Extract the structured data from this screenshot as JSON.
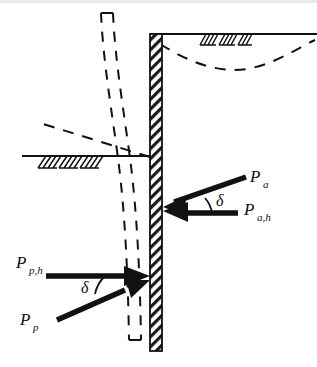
{
  "figure": {
    "kind": "engineering-diagram",
    "title": "",
    "background_color": "#ffffff",
    "line_color": "#111111",
    "width": 317,
    "height": 367
  },
  "labels": {
    "active_resultant": {
      "symbol": "P",
      "subscript": "a"
    },
    "active_horizontal": {
      "symbol": "P",
      "subscript": "a,h"
    },
    "passive_resultant": {
      "symbol": "P",
      "subscript": "p"
    },
    "passive_horizontal": {
      "symbol": "P",
      "subscript": "p,h"
    },
    "angle_active": "δ",
    "angle_passive": "δ"
  },
  "elements": {
    "wall": {
      "name": "retaining-wall",
      "style": "hatched",
      "x": 150,
      "top": 34,
      "bottom": 351,
      "thickness": 12
    },
    "ground_surface_right": {
      "name": "backfill-ground-line",
      "y": 34,
      "x_start": 150,
      "x_end": 317
    },
    "ground_surface_left": {
      "name": "excavation-ground-line",
      "y": 156,
      "x_start": 22,
      "x_end": 156
    },
    "failure_surface_right": {
      "name": "dashed-failure-surface",
      "style": "dashed-curve"
    },
    "failure_surface_left": {
      "name": "dashed-failure-line",
      "style": "dashed-line"
    },
    "deflected_wall": {
      "name": "deflected-wall-outline",
      "style": "dashed-outline"
    },
    "soil_hatch_right": {
      "name": "soil-hatch-symbol-right"
    },
    "soil_hatch_left": {
      "name": "soil-hatch-symbol-left"
    }
  },
  "arrows": [
    {
      "name": "active-resultant-arrow",
      "label_key": "active_resultant",
      "direction": "down-left",
      "tip": [
        152,
        210
      ],
      "tail": [
        247,
        176
      ]
    },
    {
      "name": "active-horizontal-arrow",
      "label_key": "active_horizontal",
      "direction": "left",
      "tip": [
        152,
        212
      ],
      "tail": [
        238,
        212
      ]
    },
    {
      "name": "passive-horizontal-arrow",
      "label_key": "passive_horizontal",
      "direction": "right",
      "tip": [
        150,
        276
      ],
      "tail": [
        46,
        276
      ]
    },
    {
      "name": "passive-resultant-arrow",
      "label_key": "passive_resultant",
      "direction": "up-right",
      "tip": [
        150,
        278
      ],
      "tail": [
        56,
        319
      ]
    }
  ]
}
